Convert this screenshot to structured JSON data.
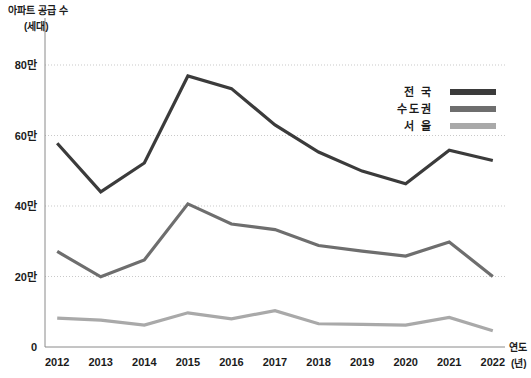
{
  "chart_data": {
    "type": "line",
    "title": "",
    "ylabel": "아파트 공급 수",
    "ylabel_unit": "(세대)",
    "xlabel": "연도",
    "xlabel_unit": "(년)",
    "categories": [
      "2012",
      "2013",
      "2014",
      "2015",
      "2016",
      "2017",
      "2018",
      "2019",
      "2020",
      "2021",
      "2022"
    ],
    "ylim": [
      0,
      880000
    ],
    "yticks": [
      0,
      200000,
      400000,
      600000,
      800000
    ],
    "ytick_labels": [
      "0",
      "20만",
      "40만",
      "60만",
      "80만"
    ],
    "grid": true,
    "legend_position": "top-right",
    "series": [
      {
        "name": "전 국",
        "color": "#3b3b3b",
        "values": [
          578000,
          440000,
          522000,
          769000,
          733000,
          630000,
          553000,
          499000,
          463000,
          558000,
          529000
        ]
      },
      {
        "name": "수도권",
        "color": "#6e6e6e",
        "values": [
          271000,
          199000,
          247000,
          406000,
          349000,
          333000,
          288000,
          272000,
          258000,
          298000,
          200000
        ]
      },
      {
        "name": "서 울",
        "color": "#a9a9a9",
        "values": [
          82000,
          76000,
          62000,
          97000,
          80000,
          103000,
          66000,
          64000,
          62000,
          84000,
          46000
        ]
      }
    ]
  }
}
